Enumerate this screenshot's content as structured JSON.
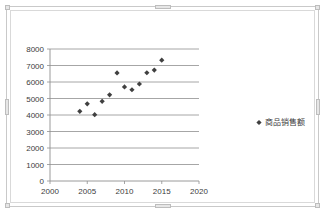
{
  "chart_data": {
    "type": "scatter",
    "title": "",
    "xlabel": "",
    "ylabel": "",
    "xlim": [
      2000,
      2020
    ],
    "ylim": [
      0,
      8000
    ],
    "xticks": [
      2000,
      2005,
      2010,
      2015,
      2020
    ],
    "yticks": [
      0,
      1000,
      2000,
      3000,
      4000,
      5000,
      6000,
      7000,
      8000
    ],
    "xtick_labels": [
      "2000",
      "2005",
      "2010",
      "2015",
      "2020"
    ],
    "ytick_labels": [
      "0",
      "1000",
      "2000",
      "3000",
      "4000",
      "5000",
      "6000",
      "7000",
      "8000"
    ],
    "grid": "horizontal",
    "legend_position": "right",
    "marker": "diamond",
    "marker_color": "#404040",
    "series": [
      {
        "name": "商品销售额",
        "points": [
          {
            "x": 2004,
            "y": 4220
          },
          {
            "x": 2005,
            "y": 4680
          },
          {
            "x": 2006,
            "y": 4020
          },
          {
            "x": 2007,
            "y": 4830
          },
          {
            "x": 2008,
            "y": 5220
          },
          {
            "x": 2009,
            "y": 6550
          },
          {
            "x": 2010,
            "y": 5700
          },
          {
            "x": 2011,
            "y": 5530
          },
          {
            "x": 2012,
            "y": 5880
          },
          {
            "x": 2013,
            "y": 6560
          },
          {
            "x": 2014,
            "y": 6720
          },
          {
            "x": 2015,
            "y": 7320
          }
        ]
      }
    ]
  },
  "legend": {
    "entries": [
      {
        "label": "商品销售额",
        "marker_color": "#404040"
      }
    ]
  },
  "colors": {
    "marker": "#404040",
    "gridline": "#8f8f8f",
    "axis": "#8f8f8f",
    "plot_background": "#ffffff",
    "frame_border": "#c9c9c9",
    "tick_label": "#3c3c3c"
  }
}
